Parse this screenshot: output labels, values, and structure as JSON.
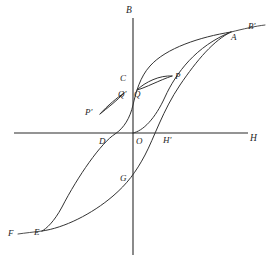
{
  "figure": {
    "background_color": "#ffffff",
    "stroke_color": "#333333",
    "axis_color": "#2b2b2b"
  },
  "axes": {
    "vertical": {
      "label": "B",
      "label_x": 126,
      "label_y": 6,
      "x": 133,
      "y_top": 18,
      "y_bottom": 255
    },
    "horizontal": {
      "label": "H",
      "label_x": 250,
      "label_y": 134,
      "y": 133,
      "x_left": 14,
      "x_right": 248
    },
    "origin": {
      "label": "O",
      "label_x": 136,
      "label_y": 137
    }
  },
  "points": [
    {
      "name": "A",
      "label": "A",
      "label_x": 231,
      "label_y": 33,
      "x": 231,
      "y": 32
    },
    {
      "name": "Bp",
      "label": "B′",
      "label_x": 248,
      "label_y": 22,
      "x": 265,
      "y": 25
    },
    {
      "name": "C",
      "label": "C",
      "label_x": 120,
      "label_y": 74,
      "x": 133,
      "y": 79
    },
    {
      "name": "D",
      "label": "D",
      "label_x": 99,
      "label_y": 137,
      "x": 104,
      "y": 133
    },
    {
      "name": "E",
      "label": "E",
      "label_x": 34,
      "label_y": 228,
      "x": 42,
      "y": 231
    },
    {
      "name": "F",
      "label": "F",
      "label_x": 8,
      "label_y": 229,
      "x": 18,
      "y": 234
    },
    {
      "name": "G",
      "label": "G",
      "label_x": 120,
      "label_y": 174,
      "x": 133,
      "y": 179
    },
    {
      "name": "Hp",
      "label": "H′",
      "label_x": 163,
      "label_y": 136,
      "x": 165,
      "y": 133
    },
    {
      "name": "P",
      "label": "P",
      "label_x": 175,
      "label_y": 72,
      "x": 172,
      "y": 76
    },
    {
      "name": "Q",
      "label": "Q",
      "label_x": 134,
      "label_y": 90,
      "x": 137,
      "y": 90
    },
    {
      "name": "Pp",
      "label": "P′",
      "label_x": 85,
      "label_y": 108,
      "x": 100,
      "y": 114
    },
    {
      "name": "Qp",
      "label": "Q′",
      "label_x": 118,
      "label_y": 90,
      "x": 124,
      "y": 93
    }
  ],
  "curves": [
    {
      "name": "initial-magnetization-curve",
      "description": "Virgin curve from origin O rising to saturation at A",
      "path": "M 133 133 C 143 131 155 119 165 97 C 176 73 196 46 231 32"
    },
    {
      "name": "descending-branch",
      "description": "Upper branch from saturation A through C (remanence) and D (coercivity) down to E and F",
      "path": "M 231 32 C 200 37 166 48 150 66 C 140 77 136 92 133 105 C 130 118 124 128 115 134 C 101 143 78 176 62 207 C 54 222 46 229 42 231"
    },
    {
      "name": "ascending-branch",
      "description": "Lower branch from F through E, G (negative remanence) and H' (coercivity) up to A",
      "path": "M 42 231 C 64 228 92 214 113 196 C 127 184 136 172 145 155 C 154 138 163 110 180 85 C 197 60 214 40 231 32"
    },
    {
      "name": "saturation-extension",
      "description": "Extension of the saturated region past A towards B'",
      "path": "M 231 32 C 243 29 256 26 265 25"
    },
    {
      "name": "saturation-extension-lower",
      "description": "Extension of the saturated region past F",
      "path": "M 42 231 C 34 232 25 233 18 234"
    }
  ],
  "minor_loops": [
    {
      "name": "minor-loop-PQ",
      "description": "Upper minor hysteresis loop between reversal points P and Q",
      "upper_path": "M 137 90 C 145 82 160 75 172 76",
      "lower_path": "M 172 76 C 160 80 145 88 137 90"
    },
    {
      "name": "minor-loop-PpQp",
      "description": "Lower minor hysteresis loop between reversal points P' and Q'",
      "upper_path": "M 100 114 C 107 106 118 97 124 93",
      "lower_path": "M 124 93 C 118 100 106 109 100 114"
    }
  ]
}
